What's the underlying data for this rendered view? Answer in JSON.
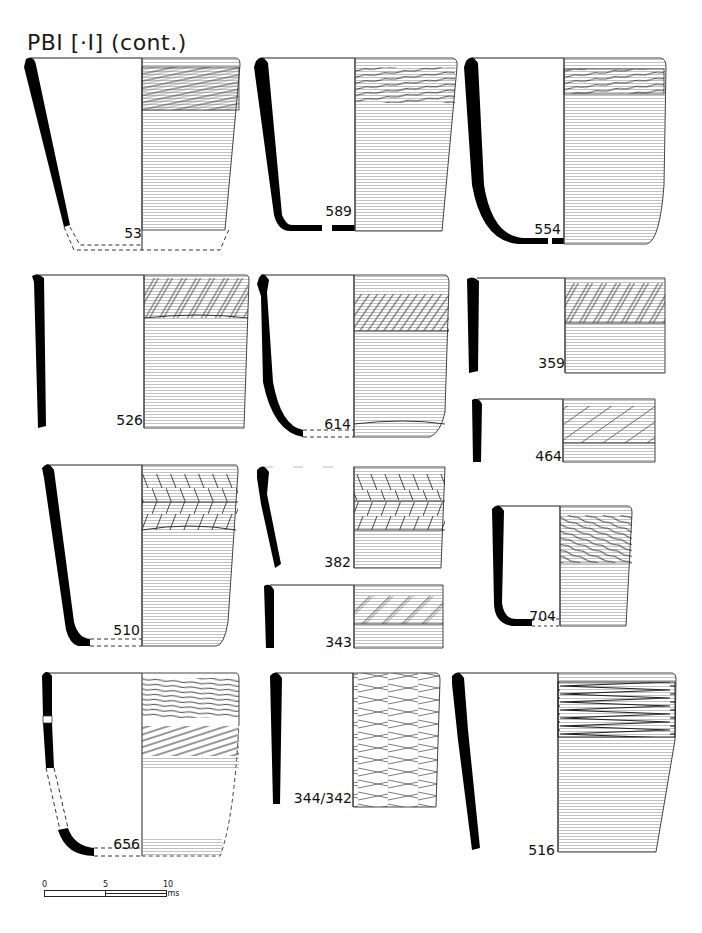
{
  "plate": {
    "title": "PBI [·I] (cont.)"
  },
  "pots": [
    {
      "id": "53",
      "row": 1,
      "col": 1,
      "decoration": "diagonal-incised-band",
      "base": "reconstructed-dashed"
    },
    {
      "id": "589",
      "row": 1,
      "col": 2,
      "decoration": "curved-incised-band",
      "base": "flat-base"
    },
    {
      "id": "554",
      "row": 1,
      "col": 3,
      "decoration": "curved-incised-band",
      "base": "rounded-flat-base"
    },
    {
      "id": "526",
      "row": 2,
      "col": 1,
      "decoration": "diagonal-ladder-band",
      "base": "rim-sherd"
    },
    {
      "id": "614",
      "row": 2,
      "col": 2,
      "decoration": "diagonal-hatched-band",
      "base": "reconstructed-dashed"
    },
    {
      "id": "359",
      "row": 2,
      "col": 3,
      "decoration": "diagonal-ladder-band",
      "base": "rim-sherd"
    },
    {
      "id": "464",
      "row": 2,
      "col": 3,
      "decoration": "diagonal-wide-band",
      "base": "rim-sherd"
    },
    {
      "id": "510",
      "row": 3,
      "col": 1,
      "decoration": "double-herringbone-band",
      "base": "reconstructed-dashed"
    },
    {
      "id": "382",
      "row": 3,
      "col": 2,
      "decoration": "double-herringbone-band",
      "base": "rim-sherd"
    },
    {
      "id": "343",
      "row": 3,
      "col": 2,
      "decoration": "diagonal-ladder-band",
      "base": "rim-sherd"
    },
    {
      "id": "704",
      "row": 3,
      "col": 3,
      "decoration": "curved-incised-band",
      "base": "reconstructed-dashed"
    },
    {
      "id": "656",
      "row": 4,
      "col": 1,
      "decoration": "two-incised-bands",
      "base": "reconstructed-dashed"
    },
    {
      "id": "344/342",
      "row": 4,
      "col": 2,
      "decoration": "crossing-incised-lines",
      "base": "rim-sherd"
    },
    {
      "id": "516",
      "row": 4,
      "col": 3,
      "decoration": "chevron-herringbone-band",
      "base": "rim-sherd"
    }
  ],
  "scale_bar": {
    "ticks": [
      "0",
      "5",
      "10 cms"
    ],
    "length_cm": 10
  },
  "colors": {
    "section_fill": "#000000",
    "line": "#222222",
    "hatch": "#555555",
    "background": "#ffffff"
  }
}
